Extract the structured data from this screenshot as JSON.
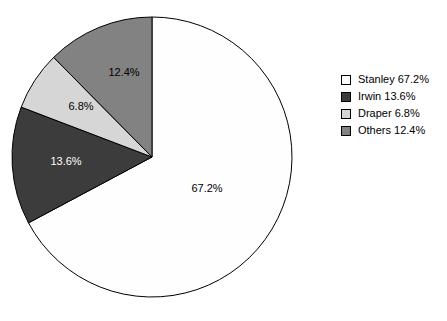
{
  "chart_data": {
    "type": "pie",
    "title": "",
    "subtitle": "",
    "xlabel": "",
    "ylabel": "",
    "grid": false,
    "legend_position": "right",
    "start_angle_deg": 0,
    "direction": "clockwise",
    "center": {
      "x": 152,
      "y": 157
    },
    "radius": 140,
    "categories": [
      "Stanley",
      "Irwin",
      "Draper",
      "Others"
    ],
    "values": [
      67.2,
      13.6,
      6.8,
      12.4
    ],
    "slices": [
      {
        "name": "Stanley",
        "value": 67.2,
        "label": "67.2%",
        "color": "#fefefe",
        "label_color": "#000000",
        "label_x": 207,
        "label_y": 189
      },
      {
        "name": "Irwin",
        "value": 13.6,
        "label": "13.6%",
        "color": "#3c3c3c",
        "label_color": "#ffffff",
        "label_x": 66,
        "label_y": 162
      },
      {
        "name": "Draper",
        "value": 6.8,
        "label": "6.8%",
        "color": "#d6d6d6",
        "label_color": "#000000",
        "label_x": 81,
        "label_y": 107
      },
      {
        "name": "Others",
        "value": 12.4,
        "label": "12.4%",
        "color": "#828282",
        "label_color": "#000000",
        "label_x": 124,
        "label_y": 73
      }
    ],
    "stroke_color": "#000000"
  },
  "legend": {
    "entries": [
      {
        "label": "Stanley 67.2%",
        "color": "#fefefe"
      },
      {
        "label": "Irwin 13.6%",
        "color": "#3c3c3c"
      },
      {
        "label": "Draper 6.8%",
        "color": "#d6d6d6"
      },
      {
        "label": "Others 12.4%",
        "color": "#828282"
      }
    ]
  }
}
